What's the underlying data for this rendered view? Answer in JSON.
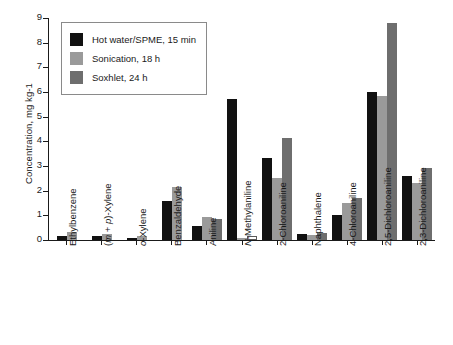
{
  "chart_data": {
    "type": "bar",
    "title": "",
    "xlabel": "",
    "ylabel": "Concentration, mg kg-1",
    "ylim": [
      0,
      9
    ],
    "yticks": [
      "0",
      "1",
      "2",
      "3",
      "4",
      "5",
      "6",
      "7",
      "8",
      "9"
    ],
    "grid": false,
    "legend_position": "top-left",
    "categories": [
      "Ethylbenzene",
      "(m + p)-Xylene",
      "o-Xylene",
      "Benzaldehyde",
      "Aniline",
      "N-Methylaniline",
      "2-Chloroaniline",
      "Naphthalene",
      "4-Chloroaniline",
      "2,5-Dichloroaniline",
      "2,3-Dichloroaniline"
    ],
    "series": [
      {
        "name": "Hot water/SPME, 15 min",
        "color": "#111111",
        "values": [
          0.18,
          0.16,
          0.1,
          1.6,
          0.55,
          5.73,
          3.31,
          0.25,
          1.01,
          6.0,
          2.59
        ]
      },
      {
        "name": "Sonication, 18 h",
        "color": "#9a9a9a",
        "values": [
          0.32,
          0.25,
          0.16,
          2.15,
          0.93,
          0.08,
          2.53,
          0.2,
          1.5,
          5.82,
          2.3
        ]
      },
      {
        "name": "Soxhlet, 24 h",
        "color": "#6e6e6e",
        "values": [
          null,
          null,
          null,
          null,
          0.87,
          0.15,
          4.13,
          0.3,
          1.72,
          8.8,
          2.9
        ]
      }
    ],
    "notes": {
      "unfilled_bars": "Soxhlet bar for N-Methylaniline is drawn white/unfilled with outline"
    }
  }
}
